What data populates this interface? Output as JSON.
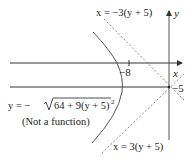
{
  "diagram": {
    "axes": {
      "x_label": "x",
      "y_label": "y"
    },
    "ticks": {
      "x_tick": "−8",
      "y_tick": "−5"
    },
    "curve": {
      "equation_lhs": "y = −",
      "equation_radicand": "64 + 9(y + 5)",
      "equation_exponent": "2",
      "note": "(Not a function)"
    },
    "asymptotes": {
      "upper": "x = −3(y + 5)",
      "lower": "x = 3(y + 5)"
    },
    "colors": {
      "axis": "#333333",
      "curve": "#555555",
      "asymptote": "#666666",
      "text": "#222222"
    }
  }
}
